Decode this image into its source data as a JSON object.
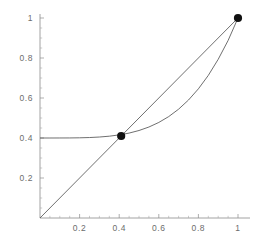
{
  "chart_data": {
    "type": "line",
    "title": "",
    "subtitle": "",
    "xlabel": "",
    "ylabel": "",
    "xlim": [
      0,
      1.06
    ],
    "ylim": [
      0,
      1.06
    ],
    "grid": false,
    "legend": null,
    "x_ticks": [
      0.2,
      0.4,
      0.6,
      0.8,
      1
    ],
    "x_tick_labels": [
      "0.2",
      "0.4",
      "0.6",
      "0.8",
      "1"
    ],
    "y_ticks": [
      0.2,
      0.4,
      0.6,
      0.8,
      1
    ],
    "y_tick_labels": [
      "0.2",
      "0.4",
      "0.6",
      "0.8",
      "1"
    ],
    "x_minor_tick_step": 0.05,
    "y_minor_tick_step": 0.05,
    "series": [
      {
        "name": "identity-line",
        "style": "solid",
        "color": "#555555",
        "x": [
          0,
          0.1,
          0.2,
          0.3,
          0.41,
          0.5,
          0.6,
          0.7,
          0.8,
          0.9,
          1
        ],
        "values": [
          0,
          0.1,
          0.2,
          0.3,
          0.41,
          0.5,
          0.6,
          0.7,
          0.8,
          0.9,
          1
        ]
      },
      {
        "name": "convex-curve",
        "style": "solid",
        "color": "#555555",
        "x": [
          0,
          0.05,
          0.1,
          0.15,
          0.2,
          0.25,
          0.3,
          0.35,
          0.41,
          0.45,
          0.5,
          0.55,
          0.6,
          0.65,
          0.7,
          0.75,
          0.8,
          0.85,
          0.9,
          0.95,
          1
        ],
        "values": [
          0.4,
          0.4,
          0.4001,
          0.4003,
          0.401,
          0.4023,
          0.4049,
          0.409,
          0.4169,
          0.4246,
          0.4375,
          0.4549,
          0.4778,
          0.507,
          0.5441,
          0.59,
          0.6458,
          0.713,
          0.7935,
          0.8876,
          1
        ]
      }
    ],
    "points": [
      {
        "name": "fixed-point-mid",
        "x": 0.41,
        "y": 0.41,
        "label": ""
      },
      {
        "name": "fixed-point-end",
        "x": 1,
        "y": 1,
        "label": ""
      }
    ]
  },
  "axes": {
    "origin_label": "",
    "x_axis_name": "x-axis",
    "y_axis_name": "y-axis"
  }
}
